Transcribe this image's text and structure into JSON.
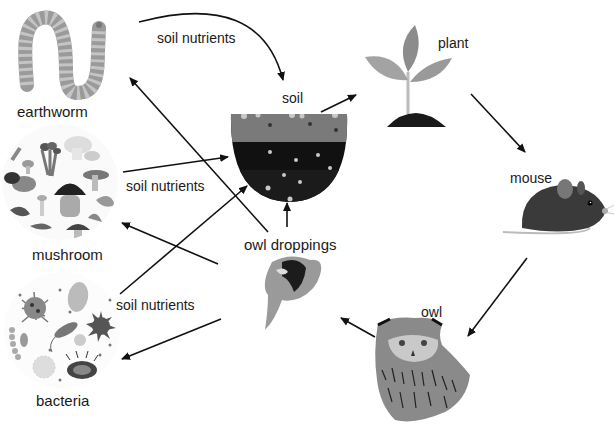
{
  "diagram": {
    "nodes": {
      "earthworm": {
        "label": "earthworm",
        "icon": "earthworm-icon"
      },
      "mushroom": {
        "label": "mushroom",
        "icon": "mushroom-icon"
      },
      "bacteria": {
        "label": "bacteria",
        "icon": "bacteria-icon"
      },
      "soil": {
        "label": "soil",
        "icon": "soil-icon"
      },
      "plant": {
        "label": "plant",
        "icon": "plant-icon"
      },
      "mouse": {
        "label": "mouse",
        "icon": "mouse-icon"
      },
      "owl": {
        "label": "owl",
        "icon": "owl-icon"
      },
      "owl_droppings": {
        "label": "owl droppings",
        "icon": "owl-droppings-icon"
      }
    },
    "edge_labels": {
      "earthworm_to_soil": "soil nutrients",
      "mushroom_to_soil": "soil nutrients",
      "bacteria_to_soil": "soil nutrients"
    },
    "edges": [
      {
        "from": "earthworm",
        "to": "soil",
        "label": "soil nutrients"
      },
      {
        "from": "mushroom",
        "to": "soil",
        "label": "soil nutrients"
      },
      {
        "from": "bacteria",
        "to": "soil",
        "label": "soil nutrients"
      },
      {
        "from": "soil",
        "to": "plant"
      },
      {
        "from": "plant",
        "to": "mouse"
      },
      {
        "from": "mouse",
        "to": "owl"
      },
      {
        "from": "owl",
        "to": "owl_droppings"
      },
      {
        "from": "owl_droppings",
        "to": "soil"
      },
      {
        "from": "owl_droppings",
        "to": "earthworm"
      },
      {
        "from": "owl_droppings",
        "to": "mushroom"
      },
      {
        "from": "owl_droppings",
        "to": "bacteria"
      }
    ]
  }
}
